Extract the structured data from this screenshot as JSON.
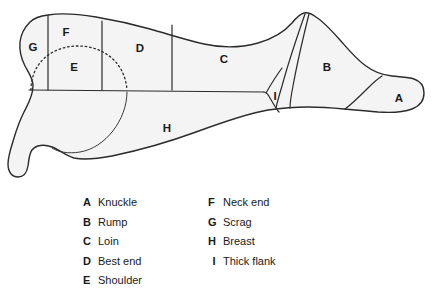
{
  "diagram": {
    "fill_color": "#f4f4f4",
    "stroke_color": "#2b2b2b",
    "background_color": "#ffffff",
    "region_labels": [
      {
        "key": "A",
        "x": 399,
        "y": 99
      },
      {
        "key": "B",
        "x": 327,
        "y": 68
      },
      {
        "key": "C",
        "x": 224,
        "y": 60
      },
      {
        "key": "D",
        "x": 140,
        "y": 49
      },
      {
        "key": "E",
        "x": 74,
        "y": 68
      },
      {
        "key": "F",
        "x": 66,
        "y": 33
      },
      {
        "key": "G",
        "x": 33,
        "y": 48
      },
      {
        "key": "H",
        "x": 167,
        "y": 129
      },
      {
        "key": "I",
        "x": 275,
        "y": 97
      }
    ]
  },
  "legend": {
    "left_column": [
      {
        "key": "A",
        "name": "Knuckle"
      },
      {
        "key": "B",
        "name": "Rump"
      },
      {
        "key": "C",
        "name": "Loin"
      },
      {
        "key": "D",
        "name": "Best end"
      },
      {
        "key": "E",
        "name": "Shoulder"
      }
    ],
    "right_column": [
      {
        "key": "F",
        "name": "Neck end"
      },
      {
        "key": "G",
        "name": "Scrag"
      },
      {
        "key": "H",
        "name": "Breast"
      },
      {
        "key": "I",
        "name": "Thick flank"
      }
    ]
  }
}
